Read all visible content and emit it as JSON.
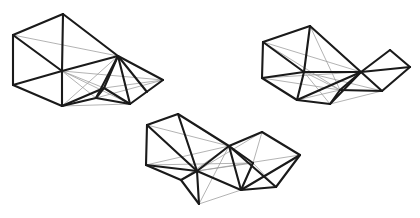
{
  "figure": {
    "background_color": "#ffffff",
    "major_edge_color": "#1a1a1a",
    "minor_edge_color": "#9a9a9a",
    "canvas_width": 420,
    "canvas_height": 218,
    "object_count": 3
  },
  "objects": [
    {
      "name": "mesh-left",
      "label": "Left wireframe mesh",
      "vertices": {
        "a": [
          63,
          14
        ],
        "b": [
          13,
          35
        ],
        "c": [
          13,
          85
        ],
        "d": [
          62,
          71
        ],
        "e": [
          62,
          106
        ],
        "f": [
          118,
          56
        ],
        "g": [
          96,
          98
        ],
        "h": [
          130,
          104
        ],
        "i": [
          163,
          80
        ],
        "j": [
          147,
          92
        ],
        "k": [
          104,
          88
        ]
      },
      "major_edges": [
        [
          "a",
          "b"
        ],
        [
          "b",
          "c"
        ],
        [
          "c",
          "e"
        ],
        [
          "a",
          "d"
        ],
        [
          "b",
          "d"
        ],
        [
          "c",
          "d"
        ],
        [
          "a",
          "f"
        ],
        [
          "d",
          "f"
        ],
        [
          "e",
          "d"
        ],
        [
          "e",
          "g"
        ],
        [
          "f",
          "g"
        ],
        [
          "f",
          "k"
        ],
        [
          "g",
          "k"
        ],
        [
          "f",
          "h"
        ],
        [
          "k",
          "h"
        ],
        [
          "f",
          "i"
        ],
        [
          "h",
          "i"
        ],
        [
          "g",
          "h"
        ],
        [
          "e",
          "k"
        ],
        [
          "f",
          "j"
        ]
      ],
      "minor_edges": [
        [
          "d",
          "g"
        ],
        [
          "d",
          "k"
        ],
        [
          "d",
          "h"
        ],
        [
          "d",
          "i"
        ],
        [
          "f",
          "e"
        ],
        [
          "b",
          "f"
        ],
        [
          "k",
          "i"
        ],
        [
          "g",
          "i"
        ],
        [
          "e",
          "h"
        ]
      ]
    },
    {
      "name": "mesh-right",
      "label": "Right wireframe mesh",
      "vertices": {
        "a": [
          310,
          26
        ],
        "b": [
          263,
          42
        ],
        "c": [
          262,
          78
        ],
        "d": [
          297,
          100
        ],
        "e": [
          330,
          104
        ],
        "f": [
          304,
          72
        ],
        "g": [
          361,
          72
        ],
        "h": [
          390,
          50
        ],
        "i": [
          410,
          67
        ],
        "j": [
          382,
          91
        ],
        "k": [
          340,
          90
        ]
      },
      "major_edges": [
        [
          "a",
          "b"
        ],
        [
          "b",
          "c"
        ],
        [
          "c",
          "d"
        ],
        [
          "a",
          "f"
        ],
        [
          "b",
          "f"
        ],
        [
          "c",
          "f"
        ],
        [
          "a",
          "g"
        ],
        [
          "f",
          "g"
        ],
        [
          "d",
          "e"
        ],
        [
          "d",
          "f"
        ],
        [
          "e",
          "g"
        ],
        [
          "g",
          "h"
        ],
        [
          "h",
          "i"
        ],
        [
          "i",
          "j"
        ],
        [
          "g",
          "j"
        ],
        [
          "g",
          "k"
        ],
        [
          "k",
          "j"
        ],
        [
          "e",
          "k"
        ],
        [
          "g",
          "i"
        ],
        [
          "d",
          "g"
        ]
      ],
      "minor_edges": [
        [
          "b",
          "g"
        ],
        [
          "c",
          "g"
        ],
        [
          "f",
          "k"
        ],
        [
          "f",
          "j"
        ],
        [
          "a",
          "k"
        ],
        [
          "c",
          "k"
        ],
        [
          "b",
          "k"
        ],
        [
          "e",
          "j"
        ],
        [
          "d",
          "k"
        ],
        [
          "f",
          "e"
        ]
      ]
    },
    {
      "name": "mesh-bottom",
      "label": "Bottom center wireframe mesh",
      "vertices": {
        "a": [
          178,
          114
        ],
        "b": [
          147,
          125
        ],
        "c": [
          146,
          165
        ],
        "d": [
          181,
          180
        ],
        "e": [
          199,
          204
        ],
        "f": [
          197,
          171
        ],
        "g": [
          229,
          146
        ],
        "h": [
          241,
          190
        ],
        "i": [
          262,
          132
        ],
        "j": [
          300,
          155
        ],
        "k": [
          276,
          187
        ],
        "l": [
          253,
          163
        ]
      },
      "major_edges": [
        [
          "a",
          "b"
        ],
        [
          "b",
          "c"
        ],
        [
          "c",
          "f"
        ],
        [
          "a",
          "f"
        ],
        [
          "b",
          "f"
        ],
        [
          "c",
          "d"
        ],
        [
          "d",
          "e"
        ],
        [
          "f",
          "e"
        ],
        [
          "a",
          "g"
        ],
        [
          "f",
          "g"
        ],
        [
          "g",
          "i"
        ],
        [
          "i",
          "j"
        ],
        [
          "j",
          "k"
        ],
        [
          "k",
          "h"
        ],
        [
          "g",
          "h"
        ],
        [
          "h",
          "j"
        ],
        [
          "g",
          "l"
        ],
        [
          "l",
          "h"
        ],
        [
          "f",
          "h"
        ],
        [
          "g",
          "k"
        ],
        [
          "d",
          "f"
        ]
      ],
      "minor_edges": [
        [
          "b",
          "g"
        ],
        [
          "c",
          "g"
        ],
        [
          "a",
          "l"
        ],
        [
          "f",
          "l"
        ],
        [
          "f",
          "i"
        ],
        [
          "f",
          "j"
        ],
        [
          "e",
          "h"
        ],
        [
          "e",
          "g"
        ],
        [
          "d",
          "g"
        ],
        [
          "i",
          "l"
        ],
        [
          "l",
          "k"
        ],
        [
          "c",
          "l"
        ]
      ]
    }
  ]
}
